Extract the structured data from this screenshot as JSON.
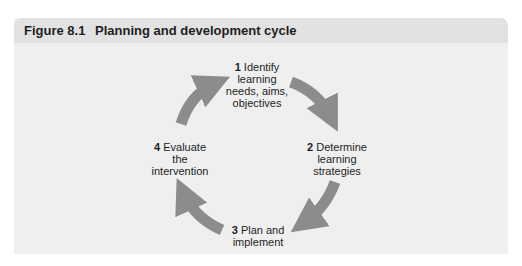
{
  "figure": {
    "number": "Figure 8.1",
    "title": "Planning and development cycle"
  },
  "colors": {
    "panel_bg": "#efefef",
    "header_bg": "#e2e2e2",
    "arrow": "#8c8c8c",
    "text": "#1e1e1e"
  },
  "cycle": {
    "nodes": [
      {
        "num": "1",
        "line1": "Identify",
        "line2": "learning",
        "line3": "needs, aims,",
        "line4": "objectives"
      },
      {
        "num": "2",
        "line1": "Determine",
        "line2": "learning",
        "line3": "strategies"
      },
      {
        "num": "3",
        "line1": "Plan and",
        "line2": "implement"
      },
      {
        "num": "4",
        "line1": "Evaluate",
        "line2": "the",
        "line3": "intervention"
      }
    ],
    "arrows": [
      {
        "from": "4",
        "to": "1",
        "icon": "curved-arrow-icon"
      },
      {
        "from": "1",
        "to": "2",
        "icon": "curved-arrow-icon"
      },
      {
        "from": "2",
        "to": "3",
        "icon": "curved-arrow-icon"
      },
      {
        "from": "3",
        "to": "4",
        "icon": "curved-arrow-icon"
      }
    ]
  }
}
